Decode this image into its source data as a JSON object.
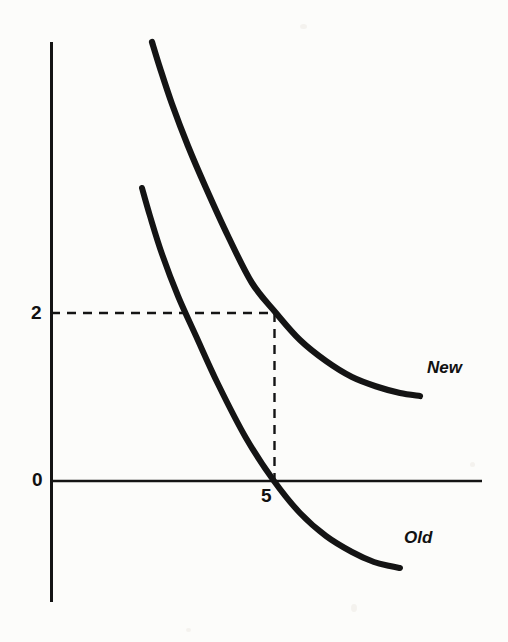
{
  "figure": {
    "background_color": "#fcfcfa",
    "ink_color": "#111111"
  },
  "axes": {
    "y_axis": {
      "x_px": 51,
      "y_top_px": 42,
      "y_bottom_px": 602,
      "width_px": 3
    },
    "x_axis": {
      "y_px": 481,
      "x_left_px": 51,
      "x_right_px": 482,
      "width_px": 2
    }
  },
  "labels": {
    "y_tick_2": "2",
    "y_tick_0": "0",
    "x_tick_5": "5",
    "curve_new": "New",
    "curve_old": "Old"
  },
  "guides": {
    "horizontal_dash_y_px": 313,
    "horizontal_dash_x_start_px": 51,
    "horizontal_dash_x_end_px": 275,
    "vertical_dash_x_px": 274,
    "vertical_dash_y_start_px": 313,
    "vertical_dash_y_end_px": 481,
    "dash_pattern": "9 7"
  },
  "chart_data": {
    "type": "line",
    "title": "",
    "xlabel": "",
    "ylabel": "",
    "grid": false,
    "legend": "inline-right",
    "annotations": [
      {
        "name": "intersection-guide",
        "description": "Dashed guides mark the New curve at x = 5, y = 2, and the Old curve crossing zero at x = 5.",
        "x": 5,
        "y": 2
      }
    ],
    "axis_ticks": {
      "x": [
        5
      ],
      "y": [
        0,
        2
      ]
    },
    "series": [
      {
        "name": "New",
        "label_text": "New",
        "x": [
          1.4,
          1.8,
          2.3,
          2.9,
          3.5,
          4.2,
          5.0,
          5.8,
          6.6,
          7.4,
          8.2,
          9.0,
          9.8,
          10.6
        ],
        "values": [
          9.6,
          8.4,
          7.0,
          5.6,
          4.4,
          3.1,
          2.0,
          1.45,
          1.05,
          0.78,
          0.6,
          0.48,
          0.42,
          0.4
        ],
        "points_px": [
          [
            152,
            42
          ],
          [
            160,
            68
          ],
          [
            172,
            104
          ],
          [
            188,
            146
          ],
          [
            206,
            188
          ],
          [
            228,
            236
          ],
          [
            252,
            283
          ],
          [
            276,
            313
          ],
          [
            300,
            340
          ],
          [
            326,
            361
          ],
          [
            352,
            377
          ],
          [
            378,
            387
          ],
          [
            400,
            393
          ],
          [
            420,
            396
          ]
        ]
      },
      {
        "name": "Old",
        "label_text": "Old",
        "x": [
          1.2,
          1.6,
          2.1,
          2.7,
          3.3,
          4.0,
          4.6,
          5.0,
          5.6,
          6.4,
          7.2,
          8.0,
          8.8,
          9.6
        ],
        "values": [
          6.3,
          5.4,
          4.3,
          3.2,
          2.3,
          1.2,
          0.45,
          0.0,
          -0.55,
          -1.15,
          -1.6,
          -1.95,
          -2.15,
          -2.25
        ],
        "points_px": [
          [
            142,
            188
          ],
          [
            150,
            216
          ],
          [
            162,
            254
          ],
          [
            178,
            296
          ],
          [
            196,
            336
          ],
          [
            218,
            384
          ],
          [
            246,
            438
          ],
          [
            274,
            481
          ],
          [
            300,
            513
          ],
          [
            326,
            536
          ],
          [
            352,
            552
          ],
          [
            374,
            562
          ],
          [
            390,
            566
          ],
          [
            400,
            568
          ]
        ]
      }
    ]
  }
}
